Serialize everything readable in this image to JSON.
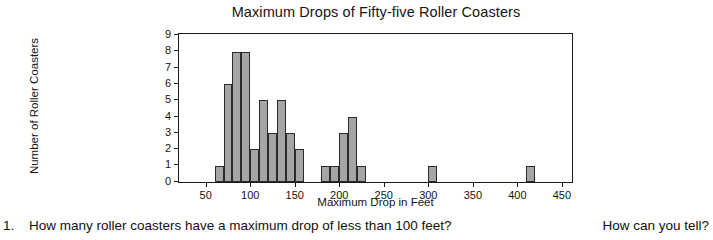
{
  "chart_data": {
    "type": "bar",
    "title": "Maximum Drops of Fifty-five Roller Coasters",
    "xlabel": "Maximum Drop in Feet",
    "ylabel": "Number of Roller Coasters",
    "xlim": [
      20,
      460
    ],
    "ylim": [
      0,
      9
    ],
    "grid": false,
    "legend": null,
    "bin_width": 10,
    "x_ticks": [
      50,
      100,
      150,
      200,
      250,
      300,
      350,
      400,
      450
    ],
    "x_tick_labels": [
      "50",
      "100",
      "150",
      "200",
      "250",
      "300",
      "350",
      "400",
      "450"
    ],
    "y_ticks": [
      0,
      1,
      2,
      3,
      4,
      5,
      6,
      7,
      8,
      9
    ],
    "y_tick_labels": [
      "0",
      "1",
      "2",
      "3",
      "4",
      "5",
      "6",
      "7",
      "8",
      "9"
    ],
    "bins": [
      {
        "start": 60,
        "end": 70,
        "count": 1
      },
      {
        "start": 70,
        "end": 80,
        "count": 6
      },
      {
        "start": 80,
        "end": 90,
        "count": 8
      },
      {
        "start": 90,
        "end": 100,
        "count": 8
      },
      {
        "start": 100,
        "end": 110,
        "count": 2
      },
      {
        "start": 110,
        "end": 120,
        "count": 5
      },
      {
        "start": 120,
        "end": 130,
        "count": 3
      },
      {
        "start": 130,
        "end": 140,
        "count": 5
      },
      {
        "start": 140,
        "end": 150,
        "count": 3
      },
      {
        "start": 150,
        "end": 160,
        "count": 2
      },
      {
        "start": 180,
        "end": 190,
        "count": 1
      },
      {
        "start": 190,
        "end": 200,
        "count": 1
      },
      {
        "start": 200,
        "end": 210,
        "count": 3
      },
      {
        "start": 210,
        "end": 220,
        "count": 4
      },
      {
        "start": 220,
        "end": 230,
        "count": 1
      },
      {
        "start": 300,
        "end": 310,
        "count": 1
      },
      {
        "start": 410,
        "end": 420,
        "count": 1
      }
    ],
    "total_count": 55,
    "bar_fill_color": "#a5a5a5",
    "bar_edge_color": "#2b2b2b",
    "axis_color": "#1a1a1a"
  },
  "question": {
    "number": "1.",
    "text": "How many roller coasters have a maximum drop of less than 100 feet?",
    "tail": "How can you tell?"
  }
}
